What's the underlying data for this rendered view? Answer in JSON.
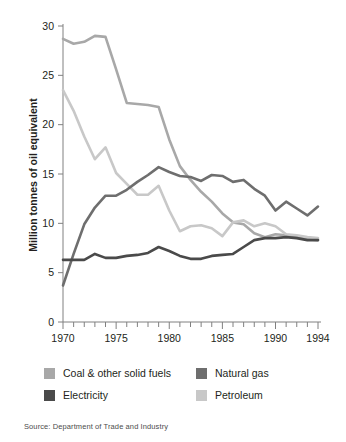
{
  "chart_data": {
    "type": "line",
    "title": "",
    "subtitle": "",
    "xlabel": "",
    "ylabel": "Million tonnes of oil equivalent",
    "xlim": [
      1970,
      1994
    ],
    "ylim": [
      0,
      30
    ],
    "yticks": [
      0,
      5,
      10,
      15,
      20,
      25,
      30
    ],
    "xticks": [
      1970,
      1975,
      1980,
      1985,
      1990,
      1994
    ],
    "xtick_labels": [
      "1970",
      "1975",
      "1980",
      "1985",
      "1990",
      "1994"
    ],
    "ytick_labels": [
      "0",
      "5",
      "10",
      "15",
      "20",
      "25",
      "30"
    ],
    "minor_xticks_every": 1,
    "grid": false,
    "legend_position": "bottom",
    "x": [
      1970,
      1971,
      1972,
      1973,
      1974,
      1975,
      1976,
      1977,
      1978,
      1979,
      1980,
      1981,
      1982,
      1983,
      1984,
      1985,
      1986,
      1987,
      1988,
      1989,
      1990,
      1991,
      1992,
      1993,
      1994
    ],
    "series": [
      {
        "name": "Coal & other solid fuels",
        "color": "#a8a8a8",
        "values": [
          28.7,
          28.2,
          28.4,
          29.0,
          28.9,
          25.6,
          22.2,
          22.1,
          22.0,
          21.8,
          18.5,
          15.8,
          14.4,
          13.2,
          12.2,
          11.0,
          10.1,
          9.9,
          9.0,
          8.6,
          8.9,
          8.8,
          8.6,
          8.4,
          8.3
        ]
      },
      {
        "name": "Natural gas",
        "color": "#6e6e6e",
        "values": [
          3.7,
          6.9,
          9.9,
          11.6,
          12.8,
          12.8,
          13.4,
          14.2,
          14.9,
          15.7,
          15.2,
          14.8,
          14.7,
          14.3,
          14.9,
          14.8,
          14.2,
          14.4,
          13.5,
          12.8,
          11.3,
          12.2,
          11.5,
          10.8,
          11.7
        ]
      },
      {
        "name": "Electricity",
        "color": "#4a4a4a",
        "values": [
          6.3,
          6.3,
          6.3,
          6.9,
          6.5,
          6.5,
          6.7,
          6.8,
          7.0,
          7.6,
          7.2,
          6.7,
          6.4,
          6.4,
          6.7,
          6.8,
          6.9,
          7.6,
          8.3,
          8.5,
          8.5,
          8.6,
          8.5,
          8.3,
          8.3
        ]
      },
      {
        "name": "Petroleum",
        "color": "#c8c8c8",
        "values": [
          23.5,
          21.4,
          18.8,
          16.5,
          17.7,
          15.1,
          14.0,
          12.9,
          12.9,
          13.8,
          11.3,
          9.2,
          9.7,
          9.8,
          9.5,
          8.7,
          10.1,
          10.3,
          9.7,
          10.0,
          9.7,
          8.9,
          8.8,
          8.6,
          8.5
        ]
      }
    ]
  },
  "axis": {
    "ylabel": "Million tonnes of oil equivalent"
  },
  "legend": {
    "items": [
      {
        "label": "Coal & other solid fuels",
        "color": "#a8a8a8"
      },
      {
        "label": "Natural gas",
        "color": "#6e6e6e"
      },
      {
        "label": "Electricity",
        "color": "#4a4a4a"
      },
      {
        "label": "Petroleum",
        "color": "#c8c8c8"
      }
    ]
  },
  "source": {
    "text": "Source: Department of Trade and Industry"
  }
}
